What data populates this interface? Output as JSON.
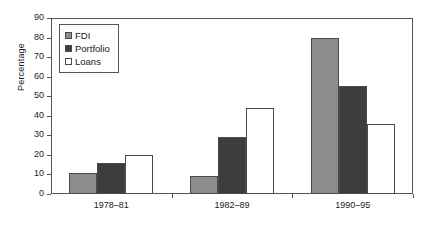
{
  "chart_data": {
    "type": "bar",
    "title": "",
    "xlabel": "",
    "ylabel": "Percentage",
    "categories": [
      "1978–81",
      "1982–89",
      "1990–95"
    ],
    "series": [
      {
        "name": "FDI",
        "values": [
          11,
          9,
          80
        ],
        "color": "#8c8c8c"
      },
      {
        "name": "Portfolio",
        "values": [
          16,
          29,
          55
        ],
        "color": "#3d3d3d"
      },
      {
        "name": "Loans",
        "values": [
          20,
          44,
          36
        ],
        "color": "#ffffff"
      }
    ],
    "ylim": [
      0,
      90
    ],
    "yticks": [
      0,
      10,
      20,
      30,
      40,
      50,
      60,
      70,
      80,
      90
    ],
    "ytick_labels": [
      "0",
      "10",
      "20",
      "30",
      "40",
      "50",
      "60",
      "70",
      "80",
      "90"
    ],
    "grid": false,
    "legend_position": "upper-left",
    "frame": true
  },
  "axis": {
    "y_title": "Percentage"
  },
  "legend": {
    "entries": [
      {
        "label": "FDI"
      },
      {
        "label": "Portfolio"
      },
      {
        "label": "Loans"
      }
    ]
  }
}
